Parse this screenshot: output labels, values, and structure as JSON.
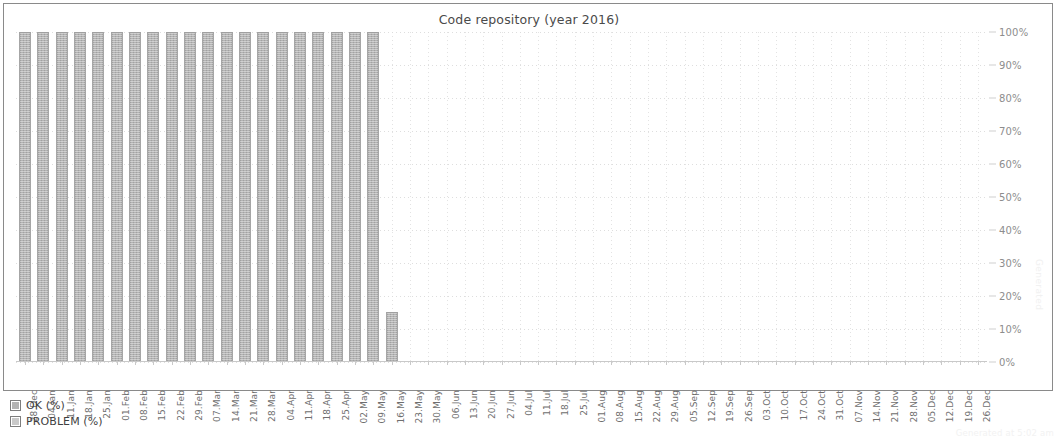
{
  "chart_data": {
    "type": "bar",
    "title": "Code repository (year 2016)",
    "xlabel": "",
    "ylabel": "",
    "ylim": [
      0,
      100
    ],
    "ytick_labels": [
      "100%",
      "90%",
      "80%",
      "70%",
      "60%",
      "50%",
      "40%",
      "30%",
      "20%",
      "10%",
      "0%"
    ],
    "ytick_values": [
      100,
      90,
      80,
      70,
      60,
      50,
      40,
      30,
      20,
      10,
      0
    ],
    "grid": true,
    "legend_position": "bottom-left",
    "legend": [
      "OK (%)",
      "PROBLEM (%)"
    ],
    "categories": [
      "28.Dec",
      "04.Jan",
      "11.Jan",
      "18.Jan",
      "25.Jan",
      "01.Feb",
      "08.Feb",
      "15.Feb",
      "22.Feb",
      "29.Feb",
      "07.Mar",
      "14.Mar",
      "21.Mar",
      "28.Mar",
      "04.Apr",
      "11.Apr",
      "18.Apr",
      "25.Apr",
      "02.May",
      "09.May",
      "16.May",
      "23.May",
      "30.May",
      "06.Jun",
      "13.Jun",
      "20.Jun",
      "27.Jun",
      "04.Jul",
      "11.Jul",
      "18.Jul",
      "25.Jul",
      "01.Aug",
      "08.Aug",
      "15.Aug",
      "22.Aug",
      "29.Aug",
      "05.Sep",
      "12.Sep",
      "19.Sep",
      "26.Sep",
      "03.Oct",
      "10.Oct",
      "17.Oct",
      "24.Oct",
      "31.Oct",
      "07.Nov",
      "14.Nov",
      "21.Nov",
      "28.Nov",
      "05.Dec",
      "12.Dec",
      "19.Dec",
      "26.Dec"
    ],
    "series": [
      {
        "name": "OK (%)",
        "color": "#b3b3b3",
        "values": [
          100,
          100,
          100,
          100,
          100,
          100,
          100,
          100,
          100,
          100,
          100,
          100,
          100,
          100,
          100,
          100,
          100,
          100,
          100,
          100,
          15,
          0,
          0,
          0,
          0,
          0,
          0,
          0,
          0,
          0,
          0,
          0,
          0,
          0,
          0,
          0,
          0,
          0,
          0,
          0,
          0,
          0,
          0,
          0,
          0,
          0,
          0,
          0,
          0,
          0,
          0,
          0,
          0
        ]
      },
      {
        "name": "PROBLEM (%)",
        "color": "#c9c9c9",
        "values": [
          0,
          0,
          0,
          0,
          0,
          0,
          0,
          0,
          0,
          0,
          0,
          0,
          0,
          0,
          0,
          0,
          0,
          0,
          0,
          0,
          0,
          0,
          0,
          0,
          0,
          0,
          0,
          0,
          0,
          0,
          0,
          0,
          0,
          0,
          0,
          0,
          0,
          0,
          0,
          0,
          0,
          0,
          0,
          0,
          0,
          0,
          0,
          0,
          0,
          0,
          0,
          0,
          0
        ]
      }
    ]
  },
  "legend": {
    "items": [
      {
        "label": "OK (%)",
        "color": "#b3b3b3"
      },
      {
        "label": "PROBLEM (%)",
        "color": "#c9c9c9"
      }
    ]
  },
  "watermark": {
    "vertical_text": "Generated",
    "footer_text": "Generated at 5:02 am"
  }
}
